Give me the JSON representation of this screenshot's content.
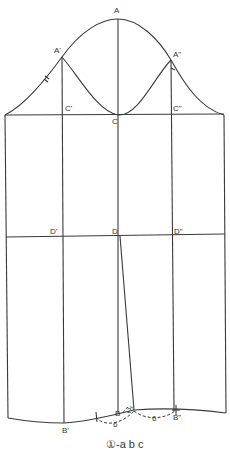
{
  "labels": {
    "A": "A",
    "A1": "A'",
    "A2": "A\"",
    "C1": "C'",
    "C": "C",
    "C2": "C\"",
    "D1": "D'",
    "D": "D",
    "D2": "D\"",
    "B1": "B'",
    "B": "B",
    "B2": "B\"",
    "measure_2": "2",
    "measure_6_left": "6",
    "measure_6_right": "6",
    "tick_mark": "//"
  },
  "caption": "①-a b c",
  "colors": {
    "line": "#3a3a3a",
    "background": "#ffffff"
  }
}
